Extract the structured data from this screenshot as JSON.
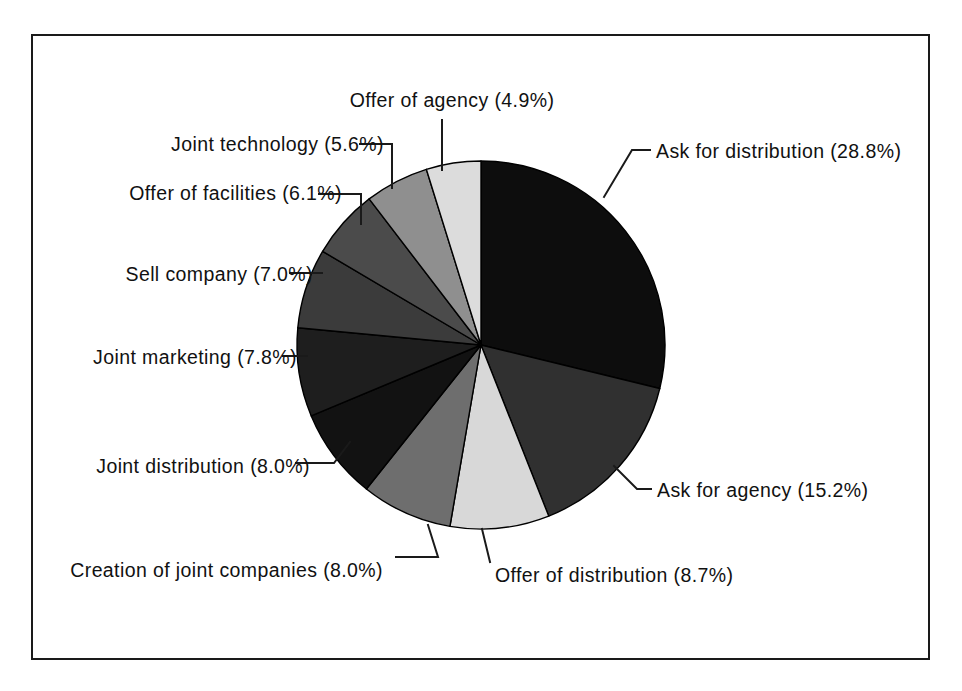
{
  "figure": {
    "background_color": "#ffffff",
    "border_color": "#1a1a1a",
    "frame": {
      "x": 31,
      "y": 34,
      "width": 899,
      "height": 626
    }
  },
  "chart_data": {
    "type": "pie",
    "title": "",
    "subtitle": "",
    "xlabel": "",
    "ylabel": "",
    "legend_position": "none",
    "grid": false,
    "start_angle_deg": 0,
    "direction": "clockwise",
    "center": {
      "x": 481,
      "y": 345
    },
    "radius": 184,
    "total_percent": 100.1,
    "categories": [
      "Ask for distribution",
      "Ask for agency",
      "Offer of distribution",
      "Creation of joint companies",
      "Joint distribution",
      "Joint marketing",
      "Sell company",
      "Offer of facilities",
      "Joint technology",
      "Offer of agency"
    ],
    "values": [
      28.8,
      15.2,
      8.7,
      8.0,
      8.0,
      7.8,
      7.0,
      6.1,
      5.6,
      4.9
    ],
    "value_suffix": "%",
    "slices": [
      {
        "label": "Ask for distribution",
        "value": 28.8,
        "label_text": "Ask for distribution (28.8%)",
        "fill": "#0d0d0d",
        "start_deg": 0,
        "end_deg": 103.68,
        "label_x": 656,
        "label_y": 158,
        "label_anchor": "start",
        "leader_points": "604,197 632,150 650,150"
      },
      {
        "label": "Ask for agency",
        "value": 15.2,
        "label_text": "Ask for agency (15.2%)",
        "fill": "#303030",
        "start_deg": 103.68,
        "end_deg": 158.4,
        "label_x": 657,
        "label_y": 497,
        "label_anchor": "start",
        "leader_points": "614,466 637,489 651,489"
      },
      {
        "label": "Offer of distribution",
        "value": 8.7,
        "label_text": "Offer of distribution (8.7%)",
        "fill": "#d8d8d8",
        "start_deg": 158.4,
        "end_deg": 189.72,
        "label_x": 495,
        "label_y": 582,
        "label_anchor": "start",
        "leader_points": "482,529 490,562"
      },
      {
        "label": "Creation of joint companies",
        "value": 8.0,
        "label_text": "Creation of joint companies (8.0%)",
        "fill": "#6e6e6e",
        "start_deg": 189.72,
        "end_deg": 218.52,
        "label_x": 383,
        "label_y": 577,
        "label_anchor": "end",
        "leader_points": "428,525 438,557 396,557"
      },
      {
        "label": "Joint distribution",
        "value": 8.0,
        "label_text": "Joint distribution (8.0%)",
        "fill": "#121212",
        "start_deg": 218.52,
        "end_deg": 247.32,
        "label_x": 310,
        "label_y": 473,
        "label_anchor": "end",
        "leader_points": "350,442 334,463 296,463"
      },
      {
        "label": "Joint marketing",
        "value": 7.8,
        "label_text": "Joint marketing (7.8%)",
        "fill": "#1e1e1e",
        "start_deg": 247.32,
        "end_deg": 275.4,
        "label_x": 297,
        "label_y": 364,
        "label_anchor": "end",
        "leader_points": "307,356 283,356"
      },
      {
        "label": "Sell company",
        "value": 7.0,
        "label_text": "Sell company (7.0%)",
        "fill": "#3b3b3b",
        "start_deg": 275.4,
        "end_deg": 300.6,
        "label_x": 313,
        "label_y": 281,
        "label_anchor": "end",
        "leader_points": "322,273 290,273"
      },
      {
        "label": "Offer of facilities",
        "value": 6.1,
        "label_text": "Offer of facilities (6.1%)",
        "fill": "#4b4b4b",
        "start_deg": 300.6,
        "end_deg": 322.56,
        "label_x": 342,
        "label_y": 200,
        "label_anchor": "end",
        "leader_points": "361,224 361,194 319,194"
      },
      {
        "label": "Joint technology",
        "value": 5.6,
        "label_text": "Joint technology (5.6%)",
        "fill": "#8f8f8f",
        "start_deg": 322.56,
        "end_deg": 342.72,
        "label_x": 384,
        "label_y": 151,
        "label_anchor": "end",
        "leader_points": "392,188 392,144 360,144"
      },
      {
        "label": "Offer of agency",
        "value": 4.9,
        "label_text": "Offer of agency (4.9%)",
        "fill": "#dcdcdc",
        "start_deg": 342.72,
        "end_deg": 360,
        "label_x": 452,
        "label_y": 107,
        "label_anchor": "middle",
        "leader_points": "442,170 442,120"
      }
    ]
  }
}
